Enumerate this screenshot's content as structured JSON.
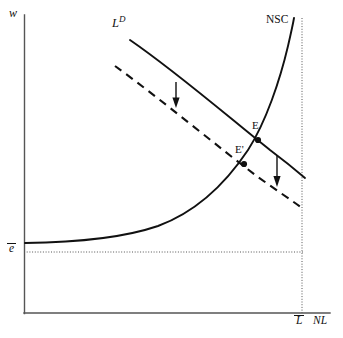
{
  "figure": {
    "type": "economics-line-diagram",
    "background_color": "#ffffff",
    "ink_color": "#111111",
    "axes": {
      "y_axis_label": "w",
      "x_axis_label": "NL",
      "y_axis_label_style": "italic",
      "x_axis_label_style": "italic",
      "origin_px": {
        "x": 24,
        "y": 313
      },
      "x_axis_end_px": {
        "x": 330,
        "y": 313
      },
      "y_axis_top_px": {
        "x": 24,
        "y": 15
      },
      "axis_color": "#555555"
    },
    "curves": [
      {
        "name": "labour-demand-original",
        "label": "L",
        "label_superscript": "D",
        "label_style": "italic",
        "style": "solid",
        "color": "#111111",
        "start_px": {
          "x": 130,
          "y": 40
        },
        "end_px": {
          "x": 305,
          "y": 178
        },
        "label_px": {
          "x": 112,
          "y": 19
        }
      },
      {
        "name": "labour-demand-shifted",
        "label": "",
        "style": "dashed",
        "color": "#111111",
        "start_px": {
          "x": 115,
          "y": 66
        },
        "end_px": {
          "x": 302,
          "y": 208
        }
      },
      {
        "name": "no-shirking-condition",
        "label": "NSC",
        "label_style": "upright",
        "style": "solid",
        "color": "#111111",
        "shape": "convex-increasing-asymptotic",
        "start_px": {
          "x": 25,
          "y": 243
        },
        "end_px": {
          "x": 294,
          "y": 18
        },
        "label_px": {
          "x": 266,
          "y": 14
        }
      }
    ],
    "points": [
      {
        "name": "equilibrium-E",
        "label": "E",
        "label_style": "upright",
        "px": {
          "x": 258,
          "y": 140
        },
        "label_px": {
          "x": 252,
          "y": 121
        },
        "marker": "filled-dot",
        "radius": 3
      },
      {
        "name": "equilibrium-E-prime",
        "label": "E'",
        "label_style": "upright",
        "px": {
          "x": 244,
          "y": 164
        },
        "label_px": {
          "x": 236,
          "y": 145
        },
        "marker": "filled-dot",
        "radius": 3
      }
    ],
    "arrows": [
      {
        "name": "shift-arrow-left",
        "direction": "down",
        "x_px": 176,
        "y_start_px": 82,
        "y_end_px": 107
      },
      {
        "name": "shift-arrow-right",
        "direction": "down",
        "x_px": 277,
        "y_start_px": 155,
        "y_end_px": 186
      }
    ],
    "guides": [
      {
        "name": "reservation-wage-guide",
        "orientation": "horizontal",
        "style": "dotted",
        "y_px": 252,
        "x_start_px": 24,
        "x_end_px": 303
      },
      {
        "name": "labour-endowment-guide",
        "orientation": "vertical",
        "style": "dotted",
        "x_px": 302,
        "y_start_px": 18,
        "y_end_px": 313
      }
    ],
    "tick_labels": [
      {
        "name": "reservation-wage-tick",
        "axis": "y",
        "text": "e",
        "overbar": true,
        "style": "italic",
        "px": {
          "x": 9,
          "y": 244
        }
      },
      {
        "name": "labour-endowment-tick",
        "axis": "x",
        "text": "L",
        "overbar": true,
        "style": "italic",
        "px": {
          "x": 296,
          "y": 316
        }
      }
    ],
    "axis_labels": [
      {
        "name": "y-axis-label",
        "text": "w",
        "style": "italic",
        "px": {
          "x": 9,
          "y": 8
        }
      },
      {
        "name": "x-axis-label",
        "text": "NL",
        "style": "italic",
        "px": {
          "x": 313,
          "y": 316
        }
      }
    ]
  }
}
